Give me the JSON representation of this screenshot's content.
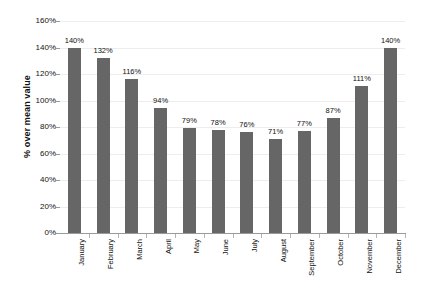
{
  "chart_data": {
    "type": "bar",
    "title": "",
    "subtitle": "",
    "xlabel": "",
    "ylabel": "% over mean value",
    "categories": [
      "January",
      "February",
      "March",
      "April",
      "May",
      "June",
      "July",
      "August",
      "September",
      "October",
      "November",
      "December"
    ],
    "values": [
      140,
      132,
      116,
      94,
      79,
      78,
      76,
      71,
      77,
      87,
      111,
      140
    ],
    "value_labels": [
      "140%",
      "132%",
      "116%",
      "94%",
      "79%",
      "78%",
      "76%",
      "71%",
      "77%",
      "87%",
      "111%",
      "140%"
    ],
    "ylim": [
      0,
      160
    ],
    "ytick_values": [
      0,
      20,
      40,
      60,
      80,
      100,
      120,
      140,
      160
    ],
    "ytick_labels": [
      "0%",
      "20%",
      "40%",
      "60%",
      "80%",
      "100%",
      "120%",
      "140%",
      "160%"
    ],
    "grid": true,
    "grid_axis": "y",
    "legend": false,
    "legend_position": "none",
    "series": [
      {
        "name": "",
        "values": [
          140,
          132,
          116,
          94,
          79,
          78,
          76,
          71,
          77,
          87,
          111,
          140
        ],
        "color": "#666666"
      }
    ],
    "colors": {
      "bar": "#666666",
      "axis": "#9a9a9a",
      "grid": "#ededed",
      "text": "#111111",
      "background": "#ffffff"
    },
    "annotations": [],
    "data_labels_shown": true,
    "xtick_label_rotation": 90
  }
}
